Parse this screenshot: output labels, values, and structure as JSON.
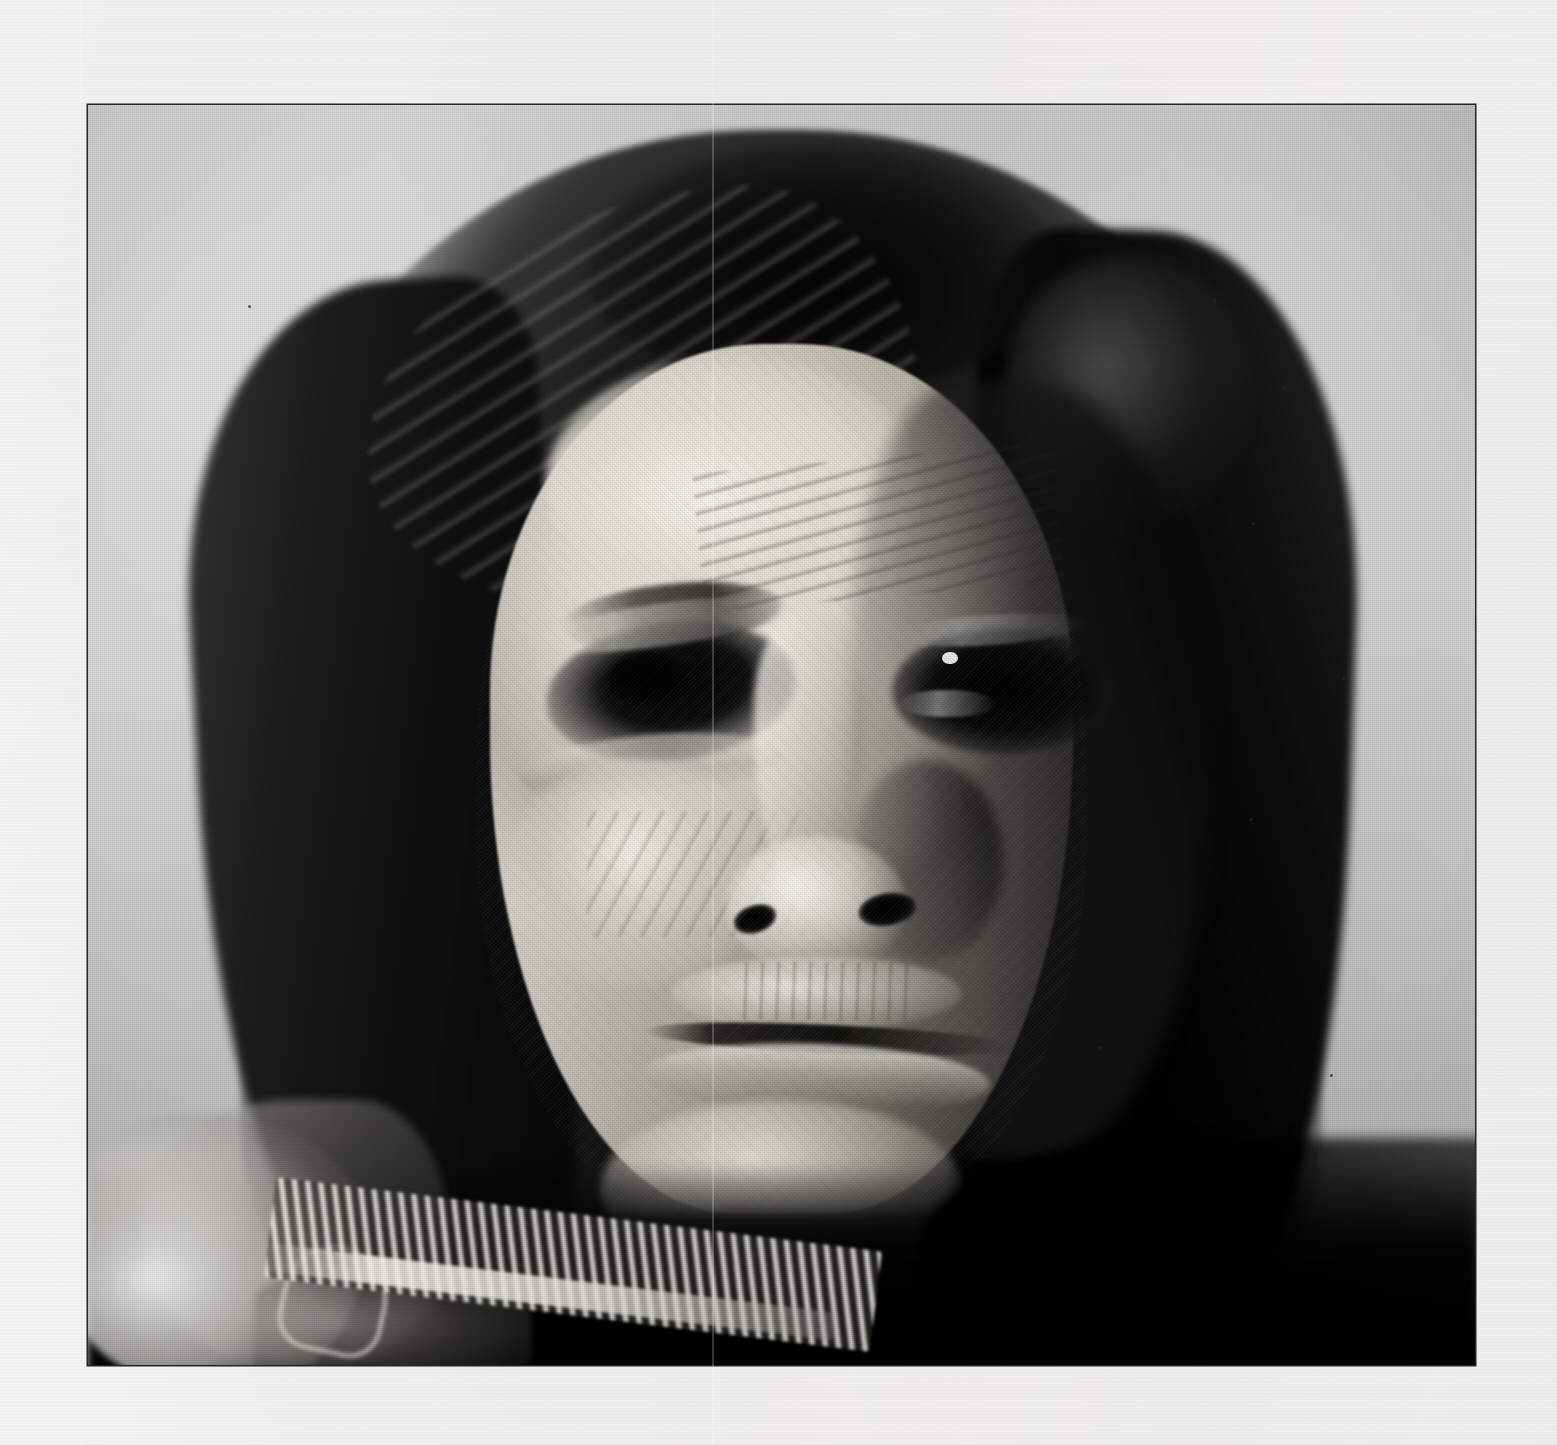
{
  "media": {
    "kind": "scanned-photographic-plate",
    "subject": "portrait-of-a-man",
    "tonality": "black-and-white halftone",
    "page_background_color": "#f4f4f2",
    "plate_border_color": "#2a2a2a",
    "backdrop_color": "#bdbdbb",
    "highlight_color": "#f4f2ec",
    "shadow_color": "#050505",
    "plate": {
      "x": 88,
      "y": 105,
      "width": 1387,
      "height": 1260
    },
    "page": {
      "width": 1557,
      "height": 1445
    }
  },
  "portrait": {
    "framing": "head and shoulders, frontal, slightly turned",
    "lighting": "strong side light from the viewer's left; right side of the face falls into deep shadow",
    "features": [
      {
        "name": "hair",
        "description": "long dark hair parted near the crown, falling past the shoulders on both sides"
      },
      {
        "name": "forehead",
        "description": "brightly lit, deeply furrowed with horizontal creases"
      },
      {
        "name": "left-eye",
        "description": "lit side; heavy lid, dark iris, crow's-feet creases"
      },
      {
        "name": "right-eye",
        "description": "in shadow; small bright catchlight on the iris"
      },
      {
        "name": "nose",
        "description": "broad, highlighted bridge and tip, dark nostrils"
      },
      {
        "name": "mouth",
        "description": "closed, level lips; vertical creases above the upper lip"
      },
      {
        "name": "chin",
        "description": "lit and textured, jaw dissolving into shadow"
      },
      {
        "name": "garment",
        "description": "dark hide shirt with a pale quill/bead strip across the left shoulder"
      }
    ]
  },
  "artifacts": {
    "creases": [
      {
        "name": "center-fold",
        "x": 712
      },
      {
        "name": "left-fold",
        "x": 80
      }
    ],
    "specks": [
      {
        "x": 1213,
        "y": 299
      },
      {
        "x": 1283,
        "y": 386
      },
      {
        "x": 1252,
        "y": 522
      },
      {
        "x": 1250,
        "y": 818
      },
      {
        "x": 1342,
        "y": 677
      },
      {
        "x": 248,
        "y": 305
      },
      {
        "x": 1098,
        "y": 1046
      },
      {
        "x": 1330,
        "y": 1074
      },
      {
        "x": 640,
        "y": 282
      }
    ],
    "paper_texture": "laid-paper horizontal ruling with halftone screen"
  }
}
